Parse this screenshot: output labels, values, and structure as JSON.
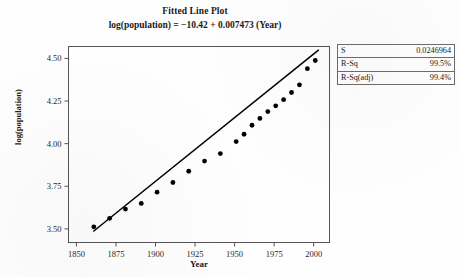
{
  "chart_data": {
    "type": "scatter",
    "title": "Fitted Line Plot",
    "subtitle": "log(population) = −10.42 + 0.007473 (Year)",
    "xlabel": "Year",
    "ylabel": "log(population)",
    "xlim": [
      1845,
      2010
    ],
    "ylim": [
      3.42,
      4.57
    ],
    "xticks": [
      1850,
      1875,
      1900,
      1925,
      1950,
      1975,
      2000
    ],
    "yticks": [
      "3.50",
      "3.75",
      "4.00",
      "4.25",
      "4.50"
    ],
    "ytick_values": [
      3.5,
      3.75,
      4.0,
      4.25,
      4.5
    ],
    "grid": false,
    "legend": "none",
    "fit": {
      "intercept": -10.42,
      "slope": 0.007473,
      "x_start": 1861,
      "x_end": 2003
    },
    "x": [
      1861,
      1871,
      1881,
      1891,
      1901,
      1911,
      1921,
      1931,
      1941,
      1951,
      1956,
      1961,
      1966,
      1971,
      1976,
      1981,
      1986,
      1991,
      1996,
      2001
    ],
    "y": [
      3.512,
      3.562,
      3.616,
      3.649,
      3.715,
      3.772,
      3.838,
      3.898,
      3.942,
      4.012,
      4.055,
      4.108,
      4.148,
      4.188,
      4.222,
      4.258,
      4.3,
      4.345,
      4.44,
      4.488
    ],
    "series": [
      {
        "name": "observed",
        "points": [
          {
            "x": 1861,
            "y": 3.512
          },
          {
            "x": 1871,
            "y": 3.562
          },
          {
            "x": 1881,
            "y": 3.616
          },
          {
            "x": 1891,
            "y": 3.649
          },
          {
            "x": 1901,
            "y": 3.715
          },
          {
            "x": 1911,
            "y": 3.772
          },
          {
            "x": 1921,
            "y": 3.838
          },
          {
            "x": 1931,
            "y": 3.898
          },
          {
            "x": 1941,
            "y": 3.942
          },
          {
            "x": 1951,
            "y": 4.012
          },
          {
            "x": 1956,
            "y": 4.055
          },
          {
            "x": 1961,
            "y": 4.108
          },
          {
            "x": 1966,
            "y": 4.148
          },
          {
            "x": 1971,
            "y": 4.188
          },
          {
            "x": 1976,
            "y": 4.222
          },
          {
            "x": 1981,
            "y": 4.258
          },
          {
            "x": 1986,
            "y": 4.3
          },
          {
            "x": 1991,
            "y": 4.345
          },
          {
            "x": 1996,
            "y": 4.44
          },
          {
            "x": 2001,
            "y": 4.488
          }
        ]
      }
    ]
  },
  "stats": {
    "rows": [
      {
        "key": "S",
        "value": "0.0246964"
      },
      {
        "key": "R-Sq",
        "value": "99.5%"
      },
      {
        "key": "R-Sq(adj)",
        "value": "99.4%"
      }
    ]
  },
  "colors": {
    "ink": "#1a1a1a",
    "frame": "#555555",
    "marker": "#000000",
    "line": "#000000"
  }
}
